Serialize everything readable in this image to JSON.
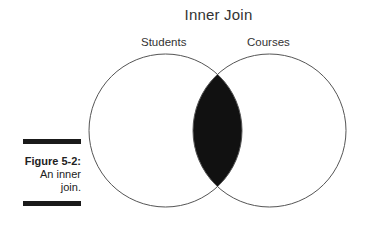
{
  "diagram": {
    "title": "Inner Join",
    "sets": [
      {
        "name": "Students",
        "cx": 165.5,
        "cy": 130.5,
        "r": 76.5
      },
      {
        "name": "Courses",
        "cx": 269.5,
        "cy": 130.5,
        "r": 76.5
      }
    ],
    "highlighted_region": "intersection",
    "fill_color": "#111111",
    "stroke_color": "#555555"
  },
  "caption": {
    "figure_number": "Figure 5-2:",
    "text_line1": "An inner",
    "text_line2": "join."
  }
}
